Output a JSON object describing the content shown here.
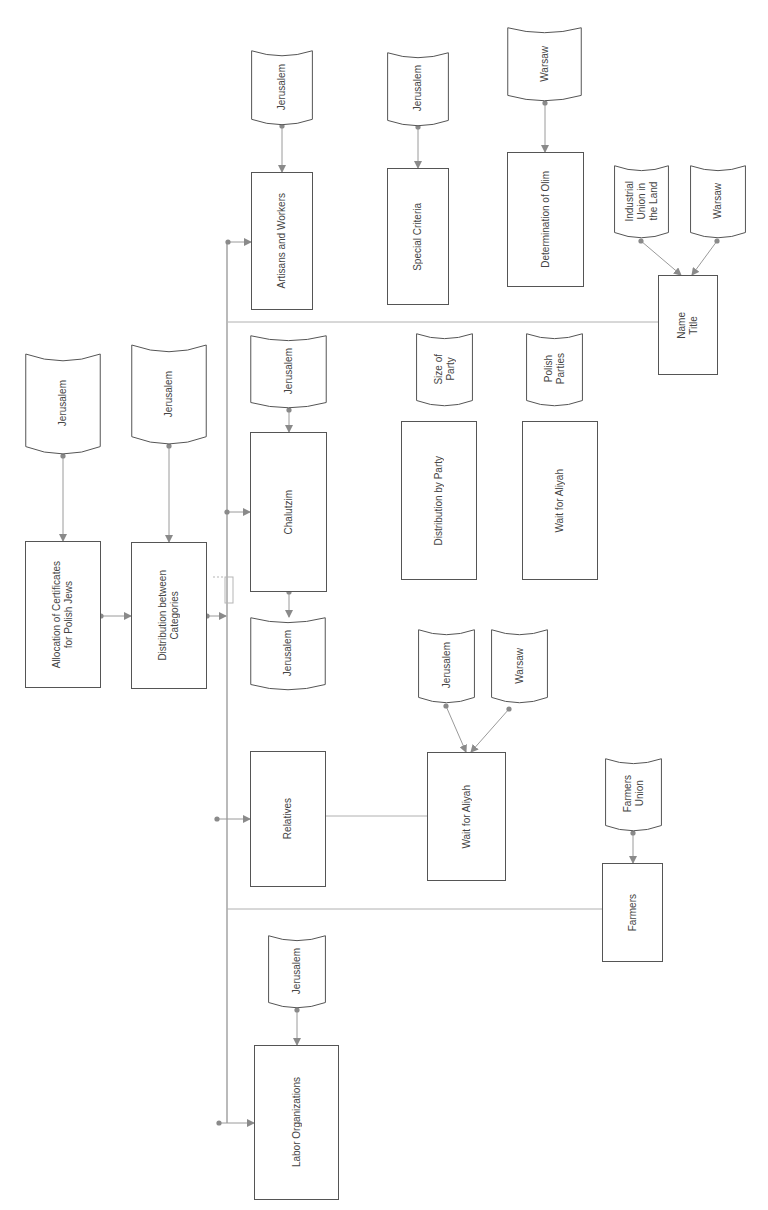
{
  "colors": {
    "box_stroke": "#555555",
    "connector": "#9a9a9a",
    "connector_dot": "#8a8a8a",
    "text": "#444444",
    "background": "#ffffff"
  },
  "diagram": {
    "orientation": "rotated 90 degrees (text reads bottom-to-top)",
    "nodes": {
      "doc_allocation_src": {
        "shape": "document",
        "label": "Jerusalem"
      },
      "proc_allocation": {
        "shape": "process",
        "label": "Allocation of Certificates\nfor Polish Jews"
      },
      "doc_distribution_src": {
        "shape": "document",
        "label": "Jerusalem"
      },
      "proc_distribution": {
        "shape": "process",
        "label": "Distribution between\nCategories"
      },
      "doc_artisans_src": {
        "shape": "document",
        "label": "Jerusalem"
      },
      "proc_artisans": {
        "shape": "process",
        "label": "Artisans and Workers"
      },
      "doc_special_src": {
        "shape": "document",
        "label": "Jerusalem"
      },
      "proc_special": {
        "shape": "process",
        "label": "Special Criteria"
      },
      "doc_olim_src": {
        "shape": "document",
        "label": "Warsaw"
      },
      "proc_olim": {
        "shape": "process",
        "label": "Determination of Olim"
      },
      "doc_industrial": {
        "shape": "document",
        "label": "Industrial\nUnion in\nthe Land"
      },
      "doc_warsaw_name": {
        "shape": "document",
        "label": "Warsaw"
      },
      "proc_name_title": {
        "shape": "process",
        "label": "Name\nTitle"
      },
      "doc_chalutzim_src": {
        "shape": "document",
        "label": "Jerusalem"
      },
      "proc_chalutzim": {
        "shape": "process",
        "label": "Chalutzim"
      },
      "doc_chalutzim_out": {
        "shape": "document",
        "label": "Jerusalem"
      },
      "doc_size_party": {
        "shape": "document",
        "label": "Size of\nParty"
      },
      "doc_polish_parties": {
        "shape": "document",
        "label": "Polish\nParties"
      },
      "proc_dist_party": {
        "shape": "process",
        "label": "Distribution by Party"
      },
      "proc_wait_aliyah_1": {
        "shape": "process",
        "label": "Wait for Aliyah"
      },
      "proc_relatives": {
        "shape": "process",
        "label": "Relatives"
      },
      "doc_wait_jerusalem": {
        "shape": "document",
        "label": "Jerusalem"
      },
      "doc_wait_warsaw": {
        "shape": "document",
        "label": "Warsaw"
      },
      "proc_wait_aliyah_2": {
        "shape": "process",
        "label": "Wait for Aliyah"
      },
      "doc_farmers_union": {
        "shape": "document",
        "label": "Farmers\nUnion"
      },
      "proc_farmers": {
        "shape": "process",
        "label": "Farmers"
      },
      "doc_labor_src": {
        "shape": "document",
        "label": "Jerusalem"
      },
      "proc_labor": {
        "shape": "process",
        "label": "Labor Organizations"
      }
    },
    "edges": [
      {
        "from": "doc_allocation_src",
        "to": "proc_allocation",
        "arrow": true
      },
      {
        "from": "doc_distribution_src",
        "to": "proc_distribution",
        "arrow": true
      },
      {
        "from": "proc_allocation",
        "to": "proc_distribution",
        "arrow": true
      },
      {
        "from": "proc_distribution",
        "to": "category_bus",
        "arrow": true
      },
      {
        "from": "category_bus",
        "to": "proc_artisans",
        "arrow": true
      },
      {
        "from": "category_bus",
        "to": "proc_chalutzim",
        "arrow": true
      },
      {
        "from": "category_bus",
        "to": "proc_relatives",
        "arrow": true
      },
      {
        "from": "category_bus",
        "to": "proc_labor",
        "arrow": true
      },
      {
        "from": "doc_artisans_src",
        "to": "proc_artisans",
        "arrow": true
      },
      {
        "from": "doc_special_src",
        "to": "proc_special",
        "arrow": true
      },
      {
        "from": "doc_olim_src",
        "to": "proc_olim",
        "arrow": true
      },
      {
        "from": "doc_industrial",
        "to": "proc_name_title",
        "arrow": true
      },
      {
        "from": "doc_warsaw_name",
        "to": "proc_name_title",
        "arrow": true
      },
      {
        "from": "category_bus",
        "to": "proc_name_title",
        "arrow": false
      },
      {
        "from": "doc_chalutzim_src",
        "to": "proc_chalutzim",
        "arrow": true
      },
      {
        "from": "proc_chalutzim",
        "to": "doc_chalutzim_out",
        "arrow": true
      },
      {
        "from": "proc_relatives",
        "to": "proc_wait_aliyah_2",
        "arrow": false
      },
      {
        "from": "doc_wait_jerusalem",
        "to": "proc_wait_aliyah_2",
        "arrow": true
      },
      {
        "from": "doc_wait_warsaw",
        "to": "proc_wait_aliyah_2",
        "arrow": true
      },
      {
        "from": "category_bus",
        "to": "proc_farmers",
        "arrow": false
      },
      {
        "from": "doc_farmers_union",
        "to": "proc_farmers",
        "arrow": true
      },
      {
        "from": "doc_labor_src",
        "to": "proc_labor",
        "arrow": true
      }
    ]
  }
}
